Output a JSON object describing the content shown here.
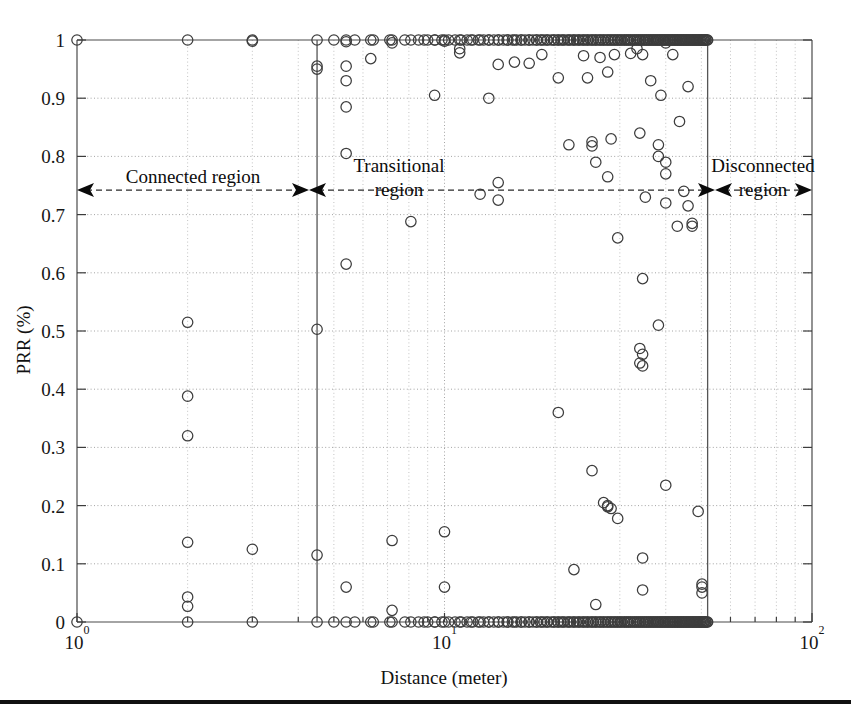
{
  "figure": {
    "background_color": "#ffffff",
    "marker_color": "#3d3d3d",
    "axis_color": "#4a4a4a",
    "grid_color": "#9a9a9a"
  },
  "axis": {
    "x_title": "Distance (meter)",
    "y_title": "PRR (%)",
    "x_tick_labels": [
      "10",
      "10",
      "10"
    ],
    "x_tick_exponents": [
      "0",
      "1",
      "2"
    ],
    "x_tick_values": [
      1,
      10,
      100
    ],
    "y_tick_labels": [
      "0",
      "0.1",
      "0.2",
      "0.3",
      "0.4",
      "0.5",
      "0.6",
      "0.7",
      "0.8",
      "0.9",
      "1"
    ]
  },
  "annotations": {
    "connected": {
      "line1": "Connected region",
      "line2": ""
    },
    "transitional": {
      "line1": "Transitional",
      "line2": "region"
    },
    "disconnected": {
      "line1": "Disconnected",
      "line2": "region"
    }
  },
  "chart_data": {
    "type": "scatter",
    "title": "",
    "xlabel": "Distance (meter)",
    "ylabel": "PRR (%)",
    "xscale": "log",
    "yscale": "linear",
    "xlim": [
      1,
      100
    ],
    "ylim": [
      0,
      1
    ],
    "grid": true,
    "legend": null,
    "marker": "open-circle",
    "region_boundaries": {
      "connected_end": 4.5,
      "transitional_end": 52.0
    },
    "regions": [
      {
        "name": "Connected region",
        "x_start": 1.0,
        "x_end": 4.5
      },
      {
        "name": "Transitional region",
        "x_start": 4.5,
        "x_end": 52.0
      },
      {
        "name": "Disconnected region",
        "x_start": 52.0,
        "x_end": 100.0
      }
    ],
    "points": [
      [
        1.0,
        1.0
      ],
      [
        1.0,
        0.0
      ],
      [
        2.0,
        1.0
      ],
      [
        2.0,
        0.515
      ],
      [
        2.0,
        0.388
      ],
      [
        2.0,
        0.32
      ],
      [
        2.0,
        0.137
      ],
      [
        2.0,
        0.043
      ],
      [
        2.0,
        0.027
      ],
      [
        2.0,
        0.0
      ],
      [
        3.0,
        1.0
      ],
      [
        3.0,
        0.998
      ],
      [
        3.0,
        0.125
      ],
      [
        3.0,
        0.0
      ],
      [
        4.5,
        1.0
      ],
      [
        4.5,
        0.955
      ],
      [
        4.5,
        0.95
      ],
      [
        4.5,
        0.503
      ],
      [
        4.5,
        0.115
      ],
      [
        4.5,
        0.0
      ],
      [
        5.4,
        1.0
      ],
      [
        5.4,
        0.997
      ],
      [
        5.4,
        0.955
      ],
      [
        5.4,
        0.93
      ],
      [
        5.4,
        0.885
      ],
      [
        5.4,
        0.805
      ],
      [
        5.4,
        0.615
      ],
      [
        5.4,
        0.06
      ],
      [
        5.4,
        0.0
      ],
      [
        6.3,
        1.0
      ],
      [
        6.3,
        0.968
      ],
      [
        6.3,
        0.0
      ],
      [
        7.2,
        1.0
      ],
      [
        7.2,
        0.995
      ],
      [
        7.2,
        0.14
      ],
      [
        7.2,
        0.02
      ],
      [
        7.2,
        0.0
      ],
      [
        8.1,
        1.0
      ],
      [
        8.1,
        0.688
      ],
      [
        8.1,
        0.0
      ],
      [
        8.8,
        1.0
      ],
      [
        8.8,
        0.0
      ],
      [
        9.4,
        1.0
      ],
      [
        9.4,
        0.905
      ],
      [
        9.4,
        0.0
      ],
      [
        10.0,
        1.0
      ],
      [
        10.0,
        0.998
      ],
      [
        10.0,
        0.155
      ],
      [
        10.0,
        0.06
      ],
      [
        10.0,
        0.0
      ],
      [
        11.0,
        1.0
      ],
      [
        11.0,
        0.985
      ],
      [
        11.0,
        0.978
      ],
      [
        11.0,
        0.0
      ],
      [
        11.8,
        1.0
      ],
      [
        11.8,
        0.0
      ],
      [
        12.5,
        1.0
      ],
      [
        12.5,
        0.735
      ],
      [
        12.5,
        0.0
      ],
      [
        13.2,
        1.0
      ],
      [
        13.2,
        0.9
      ],
      [
        13.2,
        0.0
      ],
      [
        14.0,
        1.0
      ],
      [
        14.0,
        0.958
      ],
      [
        14.0,
        0.755
      ],
      [
        14.0,
        0.725
      ],
      [
        14.0,
        0.0
      ],
      [
        14.8,
        1.0
      ],
      [
        14.8,
        0.0
      ],
      [
        15.5,
        1.0
      ],
      [
        15.5,
        0.962
      ],
      [
        15.5,
        0.0
      ],
      [
        16.2,
        1.0
      ],
      [
        16.2,
        0.0
      ],
      [
        17.0,
        1.0
      ],
      [
        17.0,
        0.96
      ],
      [
        17.0,
        0.0
      ],
      [
        17.8,
        1.0
      ],
      [
        17.8,
        0.0
      ],
      [
        18.4,
        1.0
      ],
      [
        18.4,
        0.975
      ],
      [
        18.4,
        0.0
      ],
      [
        19.0,
        1.0
      ],
      [
        19.0,
        0.0
      ],
      [
        19.8,
        1.0
      ],
      [
        19.8,
        0.0
      ],
      [
        20.4,
        1.0
      ],
      [
        20.4,
        0.935
      ],
      [
        20.4,
        0.36
      ],
      [
        20.4,
        0.0
      ],
      [
        21.0,
        1.0
      ],
      [
        21.0,
        0.0
      ],
      [
        21.8,
        1.0
      ],
      [
        21.8,
        0.82
      ],
      [
        21.8,
        0.0
      ],
      [
        22.5,
        1.0
      ],
      [
        22.5,
        0.09
      ],
      [
        22.5,
        0.0
      ],
      [
        23.2,
        1.0
      ],
      [
        23.2,
        0.0
      ],
      [
        23.9,
        1.0
      ],
      [
        23.9,
        0.973
      ],
      [
        23.9,
        0.0
      ],
      [
        24.5,
        1.0
      ],
      [
        24.5,
        0.935
      ],
      [
        24.5,
        0.0
      ],
      [
        25.2,
        1.0
      ],
      [
        25.2,
        0.825
      ],
      [
        25.2,
        0.818
      ],
      [
        25.2,
        0.26
      ],
      [
        25.2,
        0.0
      ],
      [
        25.8,
        1.0
      ],
      [
        25.8,
        0.79
      ],
      [
        25.8,
        0.03
      ],
      [
        25.8,
        0.0
      ],
      [
        26.5,
        1.0
      ],
      [
        26.5,
        0.97
      ],
      [
        26.5,
        0.0
      ],
      [
        27.1,
        1.0
      ],
      [
        27.1,
        0.205
      ],
      [
        27.1,
        0.0
      ],
      [
        27.8,
        1.0
      ],
      [
        27.8,
        0.945
      ],
      [
        27.8,
        0.765
      ],
      [
        27.8,
        0.2
      ],
      [
        27.8,
        0.198
      ],
      [
        27.8,
        0.0
      ],
      [
        28.4,
        1.0
      ],
      [
        28.4,
        0.83
      ],
      [
        28.4,
        0.195
      ],
      [
        28.4,
        0.0
      ],
      [
        29.0,
        1.0
      ],
      [
        29.0,
        0.975
      ],
      [
        29.0,
        0.0
      ],
      [
        29.6,
        1.0
      ],
      [
        29.6,
        0.66
      ],
      [
        29.6,
        0.178
      ],
      [
        29.6,
        0.0
      ],
      [
        30.2,
        1.0
      ],
      [
        30.2,
        0.0
      ],
      [
        30.9,
        1.0
      ],
      [
        30.9,
        0.0
      ],
      [
        31.5,
        1.0
      ],
      [
        31.5,
        0.0
      ],
      [
        32.1,
        1.0
      ],
      [
        32.1,
        0.977
      ],
      [
        32.1,
        0.0
      ],
      [
        32.8,
        1.0
      ],
      [
        32.8,
        0.0
      ],
      [
        33.4,
        1.0
      ],
      [
        33.4,
        0.985
      ],
      [
        33.4,
        0.0
      ],
      [
        34.0,
        1.0
      ],
      [
        34.0,
        0.84
      ],
      [
        34.0,
        0.47
      ],
      [
        34.0,
        0.445
      ],
      [
        34.0,
        0.0
      ],
      [
        34.6,
        1.0
      ],
      [
        34.6,
        0.975
      ],
      [
        34.6,
        0.59
      ],
      [
        34.6,
        0.46
      ],
      [
        34.6,
        0.44
      ],
      [
        34.6,
        0.11
      ],
      [
        34.6,
        0.055
      ],
      [
        34.6,
        0.0
      ],
      [
        35.2,
        1.0
      ],
      [
        35.2,
        0.73
      ],
      [
        35.2,
        0.0
      ],
      [
        35.8,
        1.0
      ],
      [
        35.8,
        0.0
      ],
      [
        36.4,
        1.0
      ],
      [
        36.4,
        0.93
      ],
      [
        36.4,
        0.0
      ],
      [
        37.0,
        1.0
      ],
      [
        37.0,
        0.0
      ],
      [
        37.6,
        1.0
      ],
      [
        37.6,
        0.0
      ],
      [
        38.2,
        1.0
      ],
      [
        38.2,
        0.82
      ],
      [
        38.2,
        0.8
      ],
      [
        38.2,
        0.51
      ],
      [
        38.2,
        0.0
      ],
      [
        38.8,
        1.0
      ],
      [
        38.8,
        0.905
      ],
      [
        38.8,
        0.0
      ],
      [
        39.4,
        1.0
      ],
      [
        39.4,
        0.0
      ],
      [
        40.0,
        1.0
      ],
      [
        40.0,
        0.995
      ],
      [
        40.0,
        0.79
      ],
      [
        40.0,
        0.77
      ],
      [
        40.0,
        0.72
      ],
      [
        40.0,
        0.235
      ],
      [
        40.0,
        0.0
      ],
      [
        40.6,
        1.0
      ],
      [
        40.6,
        0.0
      ],
      [
        41.2,
        1.0
      ],
      [
        41.2,
        0.0
      ],
      [
        41.8,
        1.0
      ],
      [
        41.8,
        0.975
      ],
      [
        41.8,
        0.0
      ],
      [
        42.4,
        1.0
      ],
      [
        42.4,
        0.0
      ],
      [
        43.0,
        1.0
      ],
      [
        43.0,
        0.68
      ],
      [
        43.0,
        0.0
      ],
      [
        43.6,
        1.0
      ],
      [
        43.6,
        0.86
      ],
      [
        43.6,
        0.0
      ],
      [
        44.2,
        1.0
      ],
      [
        44.2,
        0.0
      ],
      [
        44.8,
        1.0
      ],
      [
        44.8,
        0.74
      ],
      [
        44.8,
        0.0
      ],
      [
        45.4,
        1.0
      ],
      [
        45.4,
        0.0
      ],
      [
        46.0,
        1.0
      ],
      [
        46.0,
        0.92
      ],
      [
        46.0,
        0.715
      ],
      [
        46.0,
        0.0
      ],
      [
        46.6,
        1.0
      ],
      [
        46.6,
        0.0
      ],
      [
        47.2,
        1.0
      ],
      [
        47.2,
        0.685
      ],
      [
        47.2,
        0.68
      ],
      [
        47.2,
        0.0
      ],
      [
        47.8,
        1.0
      ],
      [
        47.8,
        0.0
      ],
      [
        48.4,
        1.0
      ],
      [
        48.4,
        0.0
      ],
      [
        49.0,
        1.0
      ],
      [
        49.0,
        0.19
      ],
      [
        49.0,
        0.0
      ],
      [
        49.6,
        1.0
      ],
      [
        49.6,
        0.0
      ],
      [
        50.2,
        1.0
      ],
      [
        50.2,
        0.065
      ],
      [
        50.2,
        0.06
      ],
      [
        50.2,
        0.05
      ],
      [
        50.2,
        0.0
      ],
      [
        50.8,
        1.0
      ],
      [
        50.8,
        0.0
      ],
      [
        51.4,
        1.0
      ],
      [
        51.4,
        0.0
      ],
      [
        52.0,
        1.0
      ],
      [
        52.0,
        0.0
      ]
    ]
  }
}
